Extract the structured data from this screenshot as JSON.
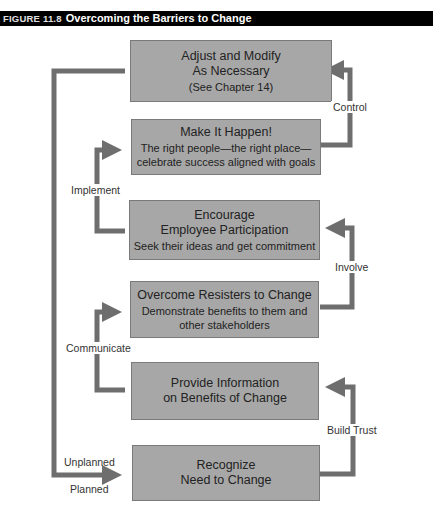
{
  "figure": {
    "number": "FIGURE 11.8",
    "title": "Overcoming the Barriers to Change"
  },
  "colors": {
    "box_fill": "#a7a7a7",
    "arrow": "#6e6e6e",
    "title_bar": "#000000"
  },
  "steps": [
    {
      "title": "Adjust and Modify",
      "title2": "As Necessary",
      "detail": "(See Chapter 14)"
    },
    {
      "title": "Make It Happen!",
      "title2": "",
      "detail": "The right people—the right place—",
      "detail2": "celebrate success aligned with goals"
    },
    {
      "title": "Encourage",
      "title2": "Employee Participation",
      "detail": "Seek their ideas and get commitment"
    },
    {
      "title": "Overcome Resisters to Change",
      "title2": "",
      "detail": "Demonstrate benefits to them and",
      "detail2": "other stakeholders"
    },
    {
      "title": "Provide Information",
      "title2": "on Benefits of Change",
      "detail": ""
    },
    {
      "title": "Recognize",
      "title2": "Need to Change",
      "detail": ""
    }
  ],
  "connectors": {
    "control": "Control",
    "implement": "Implement",
    "involve": "Involve",
    "communicate": "Communicate",
    "build_trust": "Build Trust",
    "unplanned": "Unplanned",
    "planned": "Planned"
  }
}
